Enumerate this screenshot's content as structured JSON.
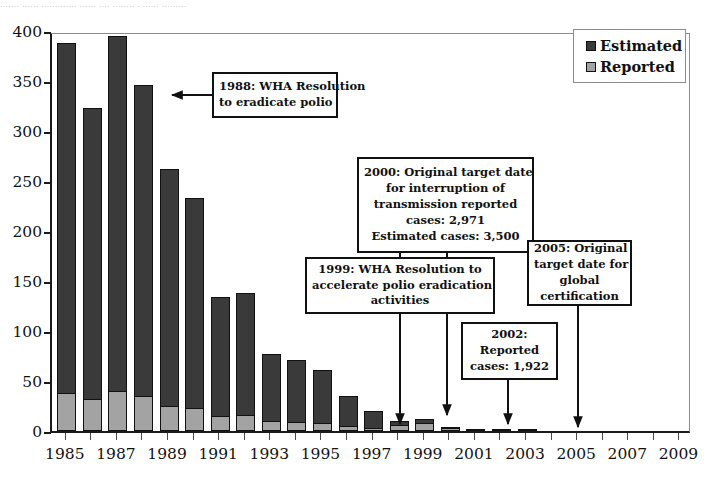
{
  "top_text_remnant": "....... ......  .............   ......  ....  ........ . ...... .........",
  "chart_data": {
    "type": "bar",
    "title": "",
    "xlabel": "",
    "ylabel": "",
    "ylim": [
      0,
      400
    ],
    "ytick_step": 50,
    "yticks": [
      "400",
      "350",
      "300",
      "250",
      "200",
      "150",
      "100",
      "50",
      "0"
    ],
    "grid": false,
    "stacked": true,
    "legend_position": "top-right",
    "xticks": [
      "1985",
      "1987",
      "1989",
      "1991",
      "1993",
      "1995",
      "1997",
      "1999",
      "2001",
      "2003",
      "2005",
      "2007",
      "2009"
    ],
    "x": [
      1985,
      1986,
      1987,
      1988,
      1989,
      1990,
      1991,
      1992,
      1993,
      1994,
      1995,
      1996,
      1997,
      1998,
      1999,
      2000,
      2001,
      2002,
      2003
    ],
    "series": [
      {
        "name": "Estimated",
        "color": "#3a3a3a",
        "values": [
          388,
          323,
          395,
          346,
          262,
          233,
          134,
          138,
          77,
          71,
          61,
          35,
          20,
          10,
          12,
          4,
          1.2,
          2.5,
          1
        ]
      },
      {
        "name": "Reported",
        "color": "#a3a3a3",
        "values": [
          38,
          32,
          40,
          35,
          25,
          23,
          15,
          16,
          10,
          9,
          8,
          5,
          3.5,
          6,
          8,
          3,
          1,
          2,
          0.8
        ]
      }
    ],
    "annotations": [
      {
        "id": "ann-1988",
        "lines": [
          "1988: WHA Resolution",
          "to eradicate polio"
        ],
        "points_to": 1988
      },
      {
        "id": "ann-2000",
        "lines": [
          "2000: Original target date",
          "for interruption of",
          "transmission reported",
          "cases:  2,971",
          "Estimated cases: 3,500"
        ],
        "points_to": 2000
      },
      {
        "id": "ann-1999",
        "lines": [
          "1999: WHA Resolution to",
          "accelerate polio eradication",
          "activities"
        ],
        "points_to": 1999
      },
      {
        "id": "ann-2002",
        "lines": [
          "2002:",
          "Reported",
          "cases: 1,922"
        ],
        "points_to": 2002
      },
      {
        "id": "ann-2005",
        "lines": [
          "2005: Original",
          "target date for",
          "global",
          "certification"
        ],
        "points_to": 2005
      }
    ]
  },
  "legend": {
    "items": [
      {
        "label": "Estimated",
        "color": "#3a3a3a"
      },
      {
        "label": "Reported",
        "color": "#a3a3a3"
      }
    ]
  }
}
